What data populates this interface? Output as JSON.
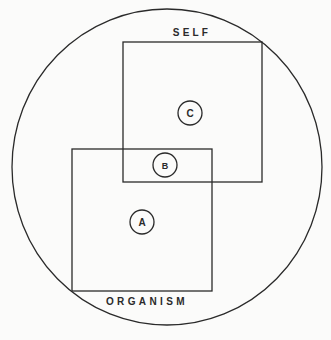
{
  "diagram": {
    "labels": {
      "self": "SELF",
      "organism": "ORGANISM"
    },
    "regions": [
      {
        "id": "A",
        "label": "A",
        "location": "organism only"
      },
      {
        "id": "B",
        "label": "B",
        "location": "overlap of self and organism"
      },
      {
        "id": "C",
        "label": "C",
        "location": "self only"
      }
    ],
    "colors": {
      "stroke": "#2a2a2a",
      "background": "#fbfbfa"
    }
  }
}
